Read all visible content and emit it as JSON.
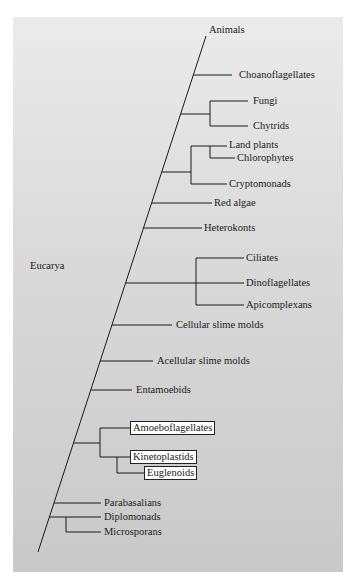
{
  "diagram": {
    "type": "phylogenetic-tree",
    "root_label": "Eucarya",
    "colors": {
      "background_panel_top": "#ebebeb",
      "background_panel_bottom": "#c9c9c9",
      "line": "#1a1a1a",
      "box_fill": "#ffffff"
    },
    "taxa": {
      "animals": "Animals",
      "choanoflagellates": "Choanoflagellates",
      "fungi": "Fungi",
      "chytrids": "Chytrids",
      "land_plants": "Land plants",
      "chlorophytes": "Chlorophytes",
      "cryptomonads": "Cryptomonads",
      "red_algae": "Red algae",
      "heterokonts": "Heterokonts",
      "ciliates": "Ciliates",
      "dinoflagellates": "Dinoflagellates",
      "apicomplexans": "Apicomplexans",
      "cellular_slime_molds": "Cellular slime molds",
      "acellular_slime_molds": "Acellular slime molds",
      "entamoebids": "Entamoebids",
      "amoeboflagellates": "Amoeboflagellates",
      "kinetoplastids": "Kinetoplastids",
      "euglenoids": "Euglenoids",
      "parabasalians": "Parabasalians",
      "diplomonads": "Diplomonads",
      "microsporans": "Microsporans"
    },
    "highlighted_taxa": [
      "Amoeboflagellates",
      "Kinetoplastids",
      "Euglenoids"
    ],
    "clades": [
      [
        "Fungi",
        "Chytrids"
      ],
      [
        [
          "Land plants",
          "Chlorophytes"
        ],
        "Cryptomonads"
      ],
      [
        "Ciliates",
        "Dinoflagellates",
        "Apicomplexans"
      ],
      [
        "Amoeboflagellates",
        [
          "Kinetoplastids",
          "Euglenoids"
        ]
      ],
      [
        "Diplomonads",
        "Microsporans"
      ]
    ]
  }
}
